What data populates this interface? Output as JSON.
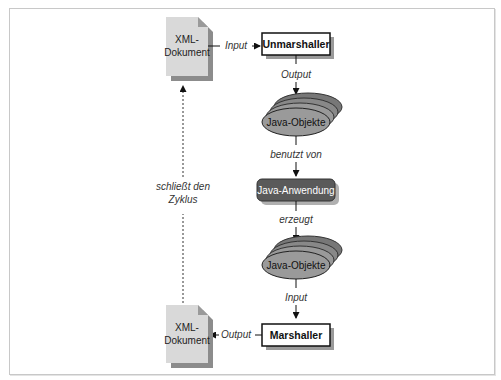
{
  "diagram": {
    "nodes": {
      "xml_doc_top": {
        "line1": "XML-",
        "line2": "Dokument"
      },
      "unmarshaller": {
        "label": "Unmarshaller"
      },
      "java_objects_top": {
        "label": "Java-Objekte"
      },
      "java_app": {
        "label": "Java-Anwendung"
      },
      "java_objects_bottom": {
        "label": "Java-Objekte"
      },
      "marshaller": {
        "label": "Marshaller"
      },
      "xml_doc_bottom": {
        "line1": "XML-",
        "line2": "Dokument"
      }
    },
    "edges": {
      "doc_to_unmarshaller": "Input",
      "unmarshaller_to_objects": "Output",
      "objects_to_app": "benutzt von",
      "app_to_objects": "erzeugt",
      "objects_to_marshaller": "Input",
      "marshaller_to_doc": "Output",
      "cycle_line1": "schließt den",
      "cycle_line2": "Zyklus"
    },
    "colors": {
      "doc_fill": "#d9d9d9",
      "doc_shadow": "#8c8c8c",
      "oval_fill": "#9a9a9a",
      "app_fill": "#5a5a5a",
      "box_border": "#111111"
    }
  }
}
